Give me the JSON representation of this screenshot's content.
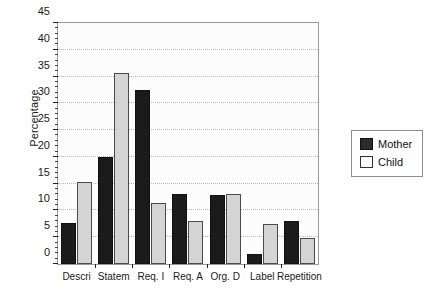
{
  "chart_data": {
    "type": "bar",
    "title": "",
    "xlabel": "",
    "ylabel": "Percentage",
    "ylim": [
      0,
      45
    ],
    "ytick_step": 5,
    "yminor_step": 1,
    "grid": true,
    "grid_axis": "y",
    "legend_position": "right-outside",
    "categories": [
      "Descri",
      "Statem",
      "Req. I",
      "Req. A",
      "Org. D",
      "Label",
      "Repetition"
    ],
    "yticks": [
      "0",
      "5",
      "10",
      "15",
      "20",
      "25",
      "30",
      "35",
      "40",
      "45"
    ],
    "series": [
      {
        "name": "Mother",
        "color": "#1b1b1b",
        "values": [
          7.7,
          20.0,
          32.5,
          13.0,
          12.8,
          1.8,
          8.0
        ]
      },
      {
        "name": "Child",
        "color": "#d4d4d4",
        "values": [
          15.4,
          35.7,
          11.4,
          8.0,
          13.0,
          7.5,
          4.8
        ]
      }
    ]
  },
  "legend": {
    "items": [
      {
        "label": "Mother",
        "swatch": "dark-square-swatch"
      },
      {
        "label": "Child",
        "swatch": "light-square-swatch"
      }
    ]
  }
}
